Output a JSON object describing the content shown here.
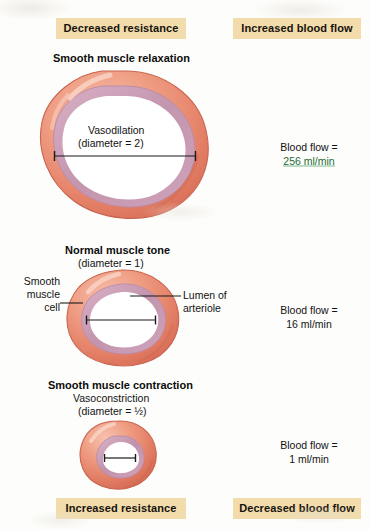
{
  "banners": {
    "top_left": "Decreased resistance",
    "top_right": "Increased blood flow",
    "bottom_left": "Increased resistance",
    "bottom_right": "Decreased blood flow",
    "color": "#f2dcab"
  },
  "sections": [
    {
      "heading": "Smooth muscle relaxation",
      "state_label": "Vasodilation",
      "diameter_label": "(diameter = 2)",
      "flow_prefix": "Blood flow =",
      "flow_value": "256 ml/min",
      "flow_highlight_color": "#1e6b34"
    },
    {
      "heading": "Normal muscle tone",
      "diameter_label": "(diameter = 1)",
      "flow_prefix": "Blood flow =",
      "flow_value": "16 ml/min"
    },
    {
      "heading": "Smooth muscle contraction",
      "state_label": "Vasoconstriction",
      "diameter_label": "(diameter = ½)",
      "flow_prefix": "Blood flow =",
      "flow_value": "1 ml/min"
    }
  ],
  "callouts": {
    "smooth_muscle_cell_line1": "Smooth",
    "smooth_muscle_cell_line2": "muscle",
    "smooth_muscle_cell_line3": "cell",
    "lumen_line1": "Lumen of",
    "lumen_line2": "arteriole"
  },
  "colors": {
    "wall_outer": "#e8806a",
    "wall_outer_light": "#f3ad97",
    "wall_inner": "#c79bb4",
    "lumen": "#ffffff",
    "background": "#fdfdfb",
    "text": "#131313"
  }
}
